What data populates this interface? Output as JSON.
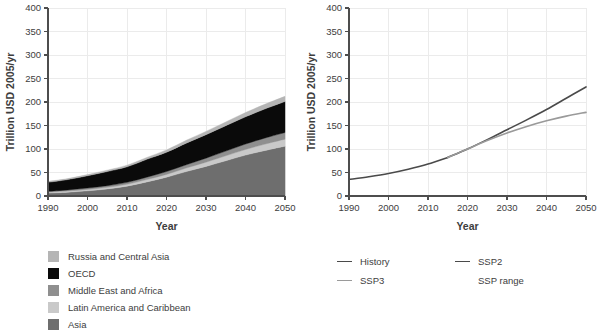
{
  "chart_data": [
    {
      "id": "left",
      "type": "area",
      "stacked": true,
      "title": "",
      "xlabel": "Year",
      "ylabel": "Trillion USD 2005/yr",
      "xlim": [
        1990,
        2050
      ],
      "ylim": [
        0,
        400
      ],
      "xticks": [
        1990,
        2000,
        2010,
        2020,
        2030,
        2040,
        2050
      ],
      "yticks": [
        0,
        50,
        100,
        150,
        200,
        250,
        300,
        350,
        400
      ],
      "grid": true,
      "legend_position": "below",
      "x": [
        1990,
        1995,
        2000,
        2005,
        2010,
        2015,
        2020,
        2025,
        2030,
        2035,
        2040,
        2045,
        2050
      ],
      "series": [
        {
          "name": "Asia",
          "color": "#6e6e6e",
          "values": [
            6,
            8,
            11,
            15,
            21,
            30,
            40,
            52,
            63,
            75,
            87,
            97,
            106
          ]
        },
        {
          "name": "Latin America and Caribbean",
          "color": "#c9c9c9",
          "values": [
            2,
            2.5,
            3,
            3.5,
            4,
            5,
            6,
            7.5,
            9,
            10.5,
            12,
            13.5,
            15
          ]
        },
        {
          "name": "Middle East and Africa",
          "color": "#8f8f8f",
          "values": [
            2,
            2.5,
            3,
            3.5,
            4,
            5,
            6,
            7,
            8.5,
            10,
            11.5,
            13,
            14
          ]
        },
        {
          "name": "OECD",
          "color": "#0a0a0a",
          "values": [
            19,
            22,
            26,
            30,
            33,
            38,
            41,
            46,
            50,
            54,
            58,
            62,
            66
          ]
        },
        {
          "name": "Russia and Central Asia",
          "color": "#b5b5b5",
          "values": [
            2,
            2,
            2.5,
            3,
            3.5,
            4,
            5,
            6,
            7,
            8,
            9,
            10,
            11
          ]
        }
      ],
      "legend": [
        {
          "label": "Russia and Central Asia",
          "color": "#b5b5b5"
        },
        {
          "label": "OECD",
          "color": "#0a0a0a"
        },
        {
          "label": "Middle East and Africa",
          "color": "#8f8f8f"
        },
        {
          "label": "Latin America and Caribbean",
          "color": "#c9c9c9"
        },
        {
          "label": "Asia",
          "color": "#6e6e6e"
        }
      ]
    },
    {
      "id": "right",
      "type": "line",
      "title": "",
      "xlabel": "Year",
      "ylabel": "Trillion USD 2005/yr",
      "xlim": [
        1990,
        2050
      ],
      "ylim": [
        0,
        400
      ],
      "xticks": [
        1990,
        2000,
        2010,
        2020,
        2030,
        2040,
        2050
      ],
      "yticks": [
        0,
        50,
        100,
        150,
        200,
        250,
        300,
        350,
        400
      ],
      "grid": true,
      "legend_position": "below",
      "series": [
        {
          "name": "History",
          "color": "#4a4a4a",
          "x": [
            1990,
            1995,
            2000,
            2005,
            2010,
            2015
          ],
          "values": [
            35,
            41,
            48,
            57,
            68,
            82
          ]
        },
        {
          "name": "SSP2",
          "color": "#4a4a4a",
          "x": [
            2015,
            2020,
            2025,
            2030,
            2035,
            2040,
            2045,
            2050
          ],
          "values": [
            82,
            100,
            120,
            141,
            162,
            184,
            208,
            232
          ]
        },
        {
          "name": "SSP3",
          "color": "#9a9a9a",
          "x": [
            2015,
            2020,
            2025,
            2030,
            2035,
            2040,
            2045,
            2050
          ],
          "values": [
            82,
            100,
            118,
            134,
            148,
            160,
            170,
            178
          ]
        }
      ],
      "legend": [
        {
          "label": "History",
          "color": "#4a4a4a",
          "marker": "line"
        },
        {
          "label": "SSP2",
          "color": "#4a4a4a",
          "marker": "line"
        },
        {
          "label": "SSP3",
          "color": "#9a9a9a",
          "marker": "line"
        },
        {
          "label": "SSP range",
          "color": "#3d3d3d",
          "marker": "none"
        }
      ]
    }
  ],
  "left_panel": {
    "ylabel": "Trillion USD 2005/yr",
    "xlabel": "Year",
    "yticks": [
      "400",
      "350",
      "300",
      "250",
      "200",
      "150",
      "100",
      "50",
      "0"
    ],
    "xticks": [
      "1990",
      "2000",
      "2010",
      "2020",
      "2030",
      "2040",
      "2050"
    ],
    "legend": {
      "item0": "Russia and Central Asia",
      "item1": "OECD",
      "item2": "Middle East and Africa",
      "item3": "Latin America and Caribbean",
      "item4": "Asia"
    }
  },
  "right_panel": {
    "ylabel": "Trillion USD 2005/yr",
    "xlabel": "Year",
    "yticks": [
      "400",
      "350",
      "300",
      "250",
      "200",
      "150",
      "100",
      "50",
      "0"
    ],
    "xticks": [
      "1990",
      "2000",
      "2010",
      "2020",
      "2030",
      "2040",
      "2050"
    ],
    "legend": {
      "item0": "History",
      "item1": "SSP2",
      "item2": "SSP3",
      "item3": "SSP range"
    }
  }
}
